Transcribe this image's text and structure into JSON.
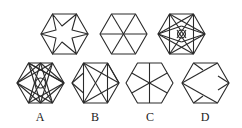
{
  "puzzle": {
    "question_row": [
      {
        "id": "q1",
        "description": "hexagon with inscribed six-pointed star"
      },
      {
        "id": "q2",
        "description": "hexagon divided into six triangles by three diagonals"
      },
      {
        "id": "q3",
        "description": "hexagon with dense star lattice and small central circle"
      }
    ],
    "options": [
      {
        "label": "A",
        "description": "hexagon with dense twelve-point star lattice and central circle"
      },
      {
        "label": "B",
        "description": "hexagon with crossing diagonal lines between vertices"
      },
      {
        "label": "C",
        "description": "hexagon divided by six spokes from center to edge midpoints/vertices"
      },
      {
        "label": "D",
        "description": "hexagon with chevron lines converging at left vertex"
      }
    ]
  },
  "colors": {
    "stroke": "#2a2a2a",
    "background": "#ffffff"
  }
}
